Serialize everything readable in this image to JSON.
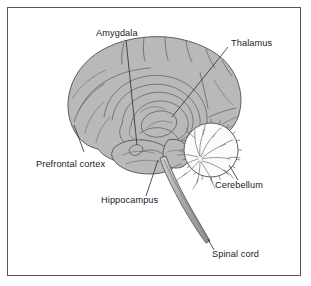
{
  "figure": {
    "kind": "anatomical-diagram",
    "frame_color": "#58585a",
    "background_color": "#ffffff",
    "brain_fill_color": "#b9b9b9",
    "brain_outline_color": "#5e5e60",
    "cerebellum_fill_color": "#fbfbfb",
    "label_color": "#1b1b1b",
    "leader_color": "#2b2b2b"
  },
  "labels": [
    {
      "id": "amygdala",
      "text": "Amygdala",
      "x": 96,
      "y": 36,
      "anchor": "start"
    },
    {
      "id": "thalamus",
      "text": "Thalamus",
      "x": 231,
      "y": 46,
      "anchor": "start"
    },
    {
      "id": "prefrontal-cortex",
      "text": "Prefrontal cortex",
      "x": 36,
      "y": 167,
      "anchor": "start"
    },
    {
      "id": "hippocampus",
      "text": "Hippocampus",
      "x": 101,
      "y": 203,
      "anchor": "start"
    },
    {
      "id": "cerebellum",
      "text": "Cerebellum",
      "x": 215,
      "y": 188,
      "anchor": "start"
    },
    {
      "id": "spinal-cord",
      "text": "Spinal cord",
      "x": 212,
      "y": 257,
      "anchor": "start"
    }
  ]
}
